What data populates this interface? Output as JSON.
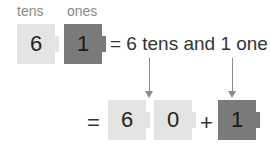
{
  "labels": {
    "tens": "tens",
    "ones": "ones"
  },
  "top_row": {
    "tens_digit": "6",
    "ones_digit": "1",
    "equation_text": "= 6 tens and 1 one"
  },
  "bottom_row": {
    "equals": "=",
    "tens_digit": "6",
    "zero_digit": "0",
    "plus": "+",
    "ones_digit": "1"
  },
  "colors": {
    "tens_block": "#e4e4e4",
    "ones_block": "#7a7a7a",
    "arrow": "#8a8a8a"
  }
}
